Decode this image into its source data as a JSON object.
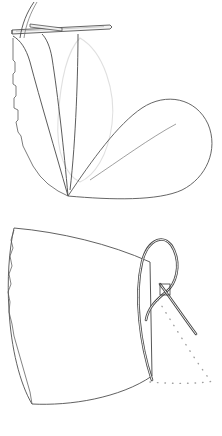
{
  "figure": {
    "background_color": "#ffffff",
    "width": 222,
    "height": 436,
    "panel_count": 2,
    "style": {
      "ruling_color": "#3c3c3c",
      "outline_color": "#555555",
      "tube_fill": "#f2f2f2",
      "tube_stroke": "#4a4a4a",
      "faint_curve_color": "#d8d8d8",
      "dotted_curve_color": "#9a9a9a",
      "hatch_color": "#6a6a6a"
    }
  },
  "panels": [
    {
      "id": "panel-top",
      "name": "top-panel",
      "label": "(a)",
      "description": "Tangent developable with a cuspidal edge; two lobes meeting at a cusp point, a horizontal tube (generating curve) across the top, and a faint silhouette loop.",
      "cusp_point": {
        "x": 68,
        "y": 196
      },
      "left_lobe": {
        "name": "left-ruled-lobe",
        "ruling_count": 58,
        "ruling_orientation": "near-vertical",
        "apex": {
          "x": 68,
          "y": 196
        },
        "top_edge_y": 34,
        "leftmost_x": 12,
        "rightmost_x": 75
      },
      "right_lobe": {
        "name": "right-hatched-lobe",
        "shape": "teardrop",
        "hatch_angle_deg": 28,
        "hatch_count": 46,
        "apex": {
          "x": 68,
          "y": 196
        },
        "bulge_center": {
          "x": 160,
          "y": 140
        },
        "rightmost_x": 212,
        "top_y": 96
      },
      "tube": {
        "name": "horizontal-generating-tube",
        "start": {
          "x": 12,
          "y": 32
        },
        "end": {
          "x": 112,
          "y": 27
        },
        "thickness": 4
      },
      "rising_curve": {
        "name": "rising-tube-tail",
        "start": {
          "x": 22,
          "y": 36
        },
        "end": {
          "x": 35,
          "y": 2
        }
      },
      "faint_loop": {
        "name": "faint-silhouette-loop",
        "top": {
          "x": 80,
          "y": 38
        },
        "bottom": {
          "x": 80,
          "y": 178
        },
        "max_x": 115
      }
    },
    {
      "id": "panel-bottom",
      "name": "bottom-panel",
      "label": "(b)",
      "description": "Fan-shaped ruled surface whose rulings converge to a focus on the right, accompanied by a self-crossing tube loop and dotted hidden curves.",
      "fan": {
        "name": "fan-ruled-surface",
        "ruling_count": 62,
        "focus_point": {
          "x": 152,
          "y": 376
        },
        "top_left": {
          "x": 14,
          "y": 228
        },
        "top_right": {
          "x": 150,
          "y": 262
        },
        "bottom_left": {
          "x": 32,
          "y": 404
        },
        "left_edge_x": 8
      },
      "loop_tube": {
        "name": "self-crossing-tube-loop",
        "crossing_point": {
          "x": 166,
          "y": 290
        },
        "top_of_loop": {
          "x": 150,
          "y": 238
        },
        "tail_end": {
          "x": 196,
          "y": 336
        },
        "bottom_end": {
          "x": 152,
          "y": 380
        },
        "thickness": 3
      },
      "dotted_curves": [
        {
          "name": "dotted-hidden-curve-upper",
          "start": {
            "x": 158,
            "y": 300
          },
          "end": {
            "x": 210,
            "y": 382
          }
        },
        {
          "name": "dotted-hidden-curve-baseline",
          "start": {
            "x": 150,
            "y": 382
          },
          "end": {
            "x": 214,
            "y": 382
          }
        }
      ]
    }
  ]
}
